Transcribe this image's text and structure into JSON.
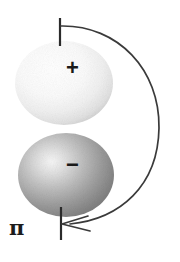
{
  "figure": {
    "background_color": "#ffffff",
    "width": 180,
    "height": 262
  },
  "labels": {
    "plus": "+",
    "minus": "−",
    "pi": "π"
  },
  "lobes": [
    {
      "name": "upper-lobe",
      "sign": "+",
      "center_x": 64,
      "center_y": 83,
      "radius_x": 49,
      "radius_y": 42,
      "highlight_color": "#ffffff",
      "edge_color": "#d8d8d8",
      "shade": "light"
    },
    {
      "name": "lower-lobe",
      "sign": "−",
      "center_x": 66,
      "center_y": 175,
      "radius_x": 48,
      "radius_y": 42,
      "highlight_color": "#f2f2f2",
      "edge_color": "#6f6f6f",
      "shade": "dark"
    }
  ],
  "axis": {
    "name": "vertical-axis-ticks",
    "x": 60,
    "top_tick": {
      "y_start": 18,
      "y_end": 46
    },
    "bottom_tick": {
      "y_start": 208,
      "y_end": 240
    },
    "color": "#2b2b2b",
    "width": 2
  },
  "arrow": {
    "name": "rotation-arrow",
    "start_x": 62,
    "start_y": 26,
    "end_x": 66,
    "end_y": 224,
    "bulge_x": 158,
    "color": "#3a3a3a",
    "stroke_width": 1.6,
    "head_direction": "left"
  },
  "colors": {
    "ink": "#2b2b2b",
    "curve": "#3a3a3a",
    "background": "#ffffff"
  }
}
